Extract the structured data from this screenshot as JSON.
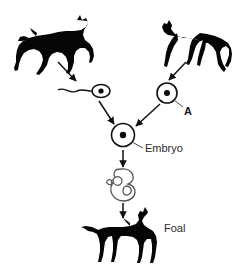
{
  "figure": {
    "background_color": "#ffffff",
    "ink_color": "#050505",
    "label_color": "#2b2b2b",
    "width": 240,
    "height": 264
  },
  "labels": {
    "egg_cell": "A",
    "embryo": "Embryo",
    "foal": "Foal"
  },
  "nodes": [
    {
      "id": "parent-horse-left",
      "kind": "horse-silhouette",
      "pose": "galloping",
      "facing": "right",
      "label": "",
      "x": 52,
      "y": 40
    },
    {
      "id": "parent-horse-right",
      "kind": "horse-silhouette",
      "pose": "trotting",
      "facing": "left",
      "label": "",
      "x": 193,
      "y": 40
    },
    {
      "id": "sperm-cell",
      "kind": "sperm-cell",
      "label": "",
      "x": 96,
      "y": 91
    },
    {
      "id": "egg-cell",
      "kind": "egg-cell",
      "label": "A",
      "x": 167,
      "y": 93
    },
    {
      "id": "embryo-cell",
      "kind": "embryo-cell",
      "label": "Embryo",
      "x": 123,
      "y": 135
    },
    {
      "id": "fetus",
      "kind": "fetus-outline",
      "label": "",
      "x": 123,
      "y": 183
    },
    {
      "id": "foal",
      "kind": "horse-silhouette",
      "pose": "standing",
      "facing": "right",
      "label": "Foal",
      "x": 123,
      "y": 232
    }
  ],
  "arrows": [
    {
      "id": "arrow-left-horse-to-sperm",
      "from": "parent-horse-left",
      "to": "sperm-cell",
      "direction": "down-right"
    },
    {
      "id": "arrow-right-horse-to-egg",
      "from": "parent-horse-right",
      "to": "egg-cell",
      "direction": "down-left"
    },
    {
      "id": "arrow-sperm-to-embryo",
      "from": "sperm-cell",
      "to": "embryo-cell",
      "direction": "down-right"
    },
    {
      "id": "arrow-egg-to-embryo",
      "from": "egg-cell",
      "to": "embryo-cell",
      "direction": "down-left"
    },
    {
      "id": "arrow-embryo-to-fetus",
      "from": "embryo-cell",
      "to": "fetus",
      "direction": "down"
    },
    {
      "id": "arrow-fetus-to-foal",
      "from": "fetus",
      "to": "foal",
      "direction": "down"
    }
  ],
  "leaders": [
    {
      "id": "leader-egg-to-label-a",
      "node": "egg-cell",
      "label": "A"
    },
    {
      "id": "leader-embryo-to-label",
      "node": "embryo-cell",
      "label": "Embryo"
    }
  ]
}
